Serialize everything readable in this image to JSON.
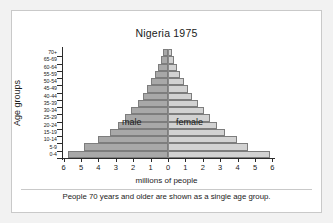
{
  "chart_data": {
    "type": "bar",
    "subtype": "population-pyramid",
    "title": "Nigeria 1975",
    "xlabel": "millions of people",
    "ylabel": "Age groups",
    "caption": "People 70 years and older are shown as a single age group.",
    "categories": [
      "0-4",
      "5-9",
      "10-14",
      "15-19",
      "20-24",
      "25-29",
      "30-34",
      "35-39",
      "40-44",
      "45-49",
      "50-54",
      "55-59",
      "60-64",
      "65-69",
      "70+"
    ],
    "x_ticks": [
      "6",
      "5",
      "4",
      "3",
      "2",
      "1",
      "0",
      "1",
      "2",
      "3",
      "4",
      "5",
      "6"
    ],
    "xlim": [
      0,
      6
    ],
    "x_unit": "millions",
    "grid": false,
    "legend_position": "inside-plot",
    "series": [
      {
        "name": "male",
        "side": "left",
        "color": "#a8a8a8",
        "values": [
          5.75,
          4.85,
          4.05,
          3.35,
          2.85,
          2.45,
          2.1,
          1.75,
          1.45,
          1.2,
          0.95,
          0.75,
          0.55,
          0.4,
          0.3
        ]
      },
      {
        "name": "female",
        "side": "right",
        "color": "#d2d2d2",
        "values": [
          5.85,
          4.6,
          3.95,
          3.3,
          2.8,
          2.4,
          2.05,
          1.7,
          1.4,
          1.15,
          0.9,
          0.7,
          0.5,
          0.35,
          0.25
        ]
      }
    ]
  },
  "labels": {
    "male": "male",
    "female": "female"
  }
}
